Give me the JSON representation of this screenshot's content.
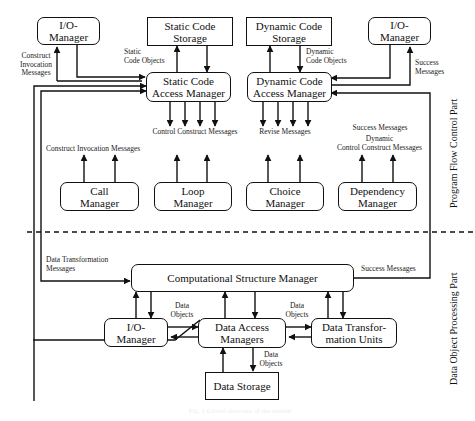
{
  "diagram": {
    "boxes": {
      "io_manager_top_left": "I/O-\nManager",
      "static_code_storage": "Static Code\nStorage",
      "dynamic_code_storage": "Dynamic Code\nStorage",
      "io_manager_top_right": "I/O-\nManager",
      "static_code_access_manager": "Static Code\nAccess Manager",
      "dynamic_code_access_manager": "Dynamic Code\nAccess Manager",
      "call_manager": "Call\nManager",
      "loop_manager": "Loop\nManager",
      "choice_manager": "Choice\nManager",
      "dependency_manager": "Dependency\nManager",
      "computational_structure_manager": "Computational Structure Manager",
      "io_manager_bottom": "I/O-\nManager",
      "data_access_managers": "Data Access\nManagers",
      "data_transformation_units": "Data Transfor-\nmation Units",
      "data_storage": "Data Storage"
    },
    "labels": {
      "construct_invocation_messages_left": "Construct\nInvocation\nMessages",
      "static_code_objects": "Static\nCode Objects",
      "dynamic_code_objects": "Dynamic\nCode Objects",
      "success_messages_top_right": "Success\nMessages",
      "control_construct_messages": "Control Construct Messages",
      "revise_messages": "Revise Messages",
      "success_messages_mid": "Success Messages",
      "dynamic_control_construct_messages": "Dynamic\nControl Construct Messages",
      "construct_invocation_messages_mid": "Construct Invocation Messages",
      "data_transformation_messages": "Data Transformation\nMessages",
      "success_messages_bottom": "Success Messages",
      "data_objects_1": "Data\nObjects",
      "data_objects_2": "Data\nObjects",
      "data_objects_3": "Data\nObjects"
    },
    "sections": {
      "top": "Program Flow Control Part",
      "bottom": "Data Object Processing Part"
    },
    "caption": "Fig. 1  Global structure of the system"
  }
}
